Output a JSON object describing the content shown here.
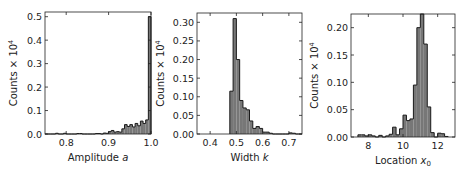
{
  "figure": {
    "bar_fill": "#777777",
    "edge_color": "#1a1a1a",
    "background": "#ffffff"
  },
  "chart_data": [
    {
      "type": "bar",
      "title": "",
      "xlabel": "Amplitude a",
      "xlabel_main": "Amplitude ",
      "xlabel_sym": "a",
      "ylabel": "Counts × 10⁴",
      "xlim": [
        0.75,
        1.0
      ],
      "ylim": [
        0,
        0.52
      ],
      "xticks": [
        0.8,
        0.9,
        1.0
      ],
      "xtick_labels": [
        "0.8",
        "0.9",
        "1.0"
      ],
      "yticks": [
        0.0,
        0.1,
        0.2,
        0.3,
        0.4,
        0.5
      ],
      "ytick_labels": [
        "0.0",
        "0.1",
        "0.2",
        "0.3",
        "0.4",
        "0.5"
      ],
      "grid": false,
      "bin_edges_start": 0.75,
      "bin_width": 0.00625,
      "values": [
        0.0,
        0.0,
        0.0,
        0.0,
        0.003,
        0.0,
        0.0,
        0.003,
        0.0,
        0.0,
        0.0,
        0.0,
        0.002,
        0.002,
        0.0,
        0.0,
        0.0,
        0.0,
        0.0,
        0.002,
        0.002,
        0.0,
        0.004,
        0.003,
        0.01,
        0.015,
        0.008,
        0.01,
        0.008,
        0.022,
        0.04,
        0.032,
        0.04,
        0.03,
        0.045,
        0.035,
        0.055,
        0.045,
        0.06,
        0.5
      ]
    },
    {
      "type": "bar",
      "title": "",
      "xlabel": "Width k",
      "xlabel_main": "Width ",
      "xlabel_sym": "k",
      "ylabel": "Counts × 10⁴",
      "xlim": [
        0.35,
        0.75
      ],
      "ylim": [
        0,
        0.325
      ],
      "xticks": [
        0.4,
        0.5,
        0.6,
        0.7
      ],
      "xtick_labels": [
        "0.4",
        "0.5",
        "0.6",
        "0.7"
      ],
      "yticks": [
        0.0,
        0.05,
        0.1,
        0.15,
        0.2,
        0.25,
        0.3
      ],
      "ytick_labels": [
        "0.00",
        "0.05",
        "0.10",
        "0.15",
        "0.20",
        "0.25",
        "0.30"
      ],
      "grid": false,
      "bin_edges_start": 0.475,
      "bin_width": 0.0125,
      "values": [
        0.115,
        0.31,
        0.2,
        0.09,
        0.07,
        0.065,
        0.035,
        0.015,
        0.02,
        0.015,
        0.005,
        0.005,
        0.002,
        0.0,
        0.0,
        0.0,
        0.0,
        0.0,
        0.003,
        0.002,
        0.0,
        0.0,
        0.003,
        0.002
      ]
    },
    {
      "type": "bar",
      "title": "",
      "xlabel": "Location x0",
      "xlabel_main": "Location ",
      "xlabel_sym": "x",
      "xlabel_sub": "0",
      "ylabel": "Counts × 10⁴",
      "xlim": [
        7.0,
        13.0
      ],
      "ylim": [
        0,
        0.225
      ],
      "xticks": [
        8,
        10,
        12
      ],
      "xtick_labels": [
        "8",
        "10",
        "12"
      ],
      "yticks": [
        0.0,
        0.05,
        0.1,
        0.15,
        0.2
      ],
      "ytick_labels": [
        "0.00",
        "0.05",
        "0.10",
        "0.15",
        "0.20"
      ],
      "grid": false,
      "bin_edges_start": 7.4,
      "bin_width": 0.2,
      "values": [
        0.004,
        0.004,
        0.002,
        0.004,
        0.002,
        0.0,
        0.003,
        0.0,
        0.002,
        0.005,
        0.018,
        0.004,
        0.015,
        0.04,
        0.03,
        0.033,
        0.095,
        0.2,
        0.225,
        0.17,
        0.055,
        0.008,
        0.0,
        0.007,
        0.006,
        0.001
      ]
    }
  ],
  "ylabel_text": "Counts × 10",
  "ylabel_sup": "4"
}
